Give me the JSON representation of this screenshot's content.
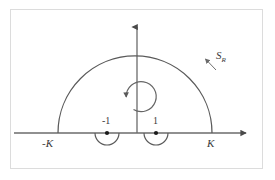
{
  "figure": {
    "type": "complex-contour-diagram",
    "background_color": "#ffffff",
    "frame_color": "#dcdcdc",
    "stroke_color": "#5a5a5a",
    "axis_color": "#6b6b6b",
    "point_color": "#1a1a1a"
  },
  "axes": {
    "horizontal": {
      "name": "real-axis",
      "y": 133,
      "x_start": 14,
      "x_end": 252,
      "arrow": "right"
    },
    "vertical": {
      "name": "imaginary-axis",
      "x": 137,
      "y_start": 133,
      "y_end": 22,
      "arrow": "up"
    }
  },
  "labels": {
    "negative_k": "-K",
    "positive_k": "K",
    "negative_one": "-1",
    "positive_one": "1",
    "contour_main": "S",
    "contour_subscript": "R"
  },
  "contour": {
    "big_arc": {
      "center_x": 135,
      "center_y": 133,
      "radius": 77,
      "left_foot_x": 58,
      "right_foot_x": 212,
      "apex_y": 56,
      "orientation": "counterclockwise"
    },
    "indentations": [
      {
        "name": "indent-at-minus-one",
        "center_x": 107,
        "center_y": 133,
        "radius": 12,
        "side": "below-axis"
      },
      {
        "name": "indent-at-plus-one",
        "center_x": 156,
        "center_y": 133,
        "radius": 12,
        "side": "below-axis"
      }
    ],
    "poles": [
      {
        "name": "pole-minus-one",
        "x": 107,
        "y": 133,
        "label": "-1"
      },
      {
        "name": "pole-plus-one",
        "x": 156,
        "y": 133,
        "label": "1"
      }
    ],
    "orientation_marker": {
      "name": "counterclockwise-circle-arrow",
      "center_x": 139,
      "center_y": 96,
      "radius": 15,
      "direction": "counterclockwise"
    },
    "contour_pointer": {
      "name": "contour-label-leader",
      "from_x": 216,
      "from_y": 70,
      "to_x": 204,
      "to_y": 58
    }
  }
}
